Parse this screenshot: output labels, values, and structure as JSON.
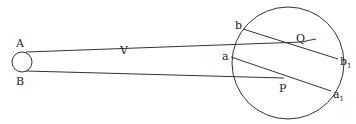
{
  "diagram": {
    "colors": {
      "stroke": "#333333",
      "text": "#222222",
      "background": "#ffffff"
    },
    "labels": {
      "A": "A",
      "B": "B",
      "V": "V",
      "b": "b",
      "a": "a",
      "Q": "Q",
      "P": "P",
      "b1_main": "b",
      "b1_sub": "1",
      "a1_main": "a",
      "a1_sub": "1"
    },
    "shapes": {
      "object_circle": {
        "cx": 22,
        "cy": 62,
        "r": 10
      },
      "sphere": {
        "cx": 288,
        "cy": 63,
        "r": 56
      }
    },
    "points": {
      "A": [
        26,
        52
      ],
      "B": [
        26,
        71
      ],
      "V": [
        124,
        58
      ],
      "Q": [
        302,
        42
      ],
      "P": [
        284,
        78
      ],
      "b": [
        243,
        29
      ],
      "b1": [
        338,
        59
      ],
      "a": [
        231,
        57
      ],
      "a1": [
        331,
        91
      ]
    }
  }
}
